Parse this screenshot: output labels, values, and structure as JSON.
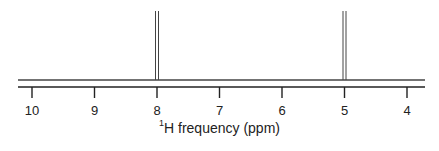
{
  "chart_data": {
    "type": "line",
    "title": "",
    "xlabel": "1H frequency (ppm)",
    "xlabel_parts": {
      "superscript": "1",
      "text": "H frequency (ppm)"
    },
    "ylabel": "",
    "xlim": [
      10.2,
      3.7
    ],
    "x_reversed": true,
    "grid": false,
    "legend": null,
    "x_ticks": [
      10,
      9,
      8,
      7,
      6,
      5,
      4
    ],
    "x_tick_labels": [
      "10",
      "9",
      "8",
      "7",
      "6",
      "5",
      "4"
    ],
    "peaks": [
      {
        "ppm": 8.0,
        "relative_height": 1.0,
        "shape": "doublet-line"
      },
      {
        "ppm": 5.0,
        "relative_height": 1.0,
        "shape": "doublet-line"
      }
    ],
    "series": [
      {
        "name": "1H NMR spectrum",
        "x": [
          10.2,
          8.0,
          8.0,
          8.0,
          5.0,
          5.0,
          5.0,
          3.7
        ],
        "y": [
          0,
          0,
          1,
          0,
          0,
          1,
          0,
          0
        ]
      }
    ]
  },
  "colors": {
    "line": "#444444",
    "axis": "#222222",
    "background": "#ffffff"
  }
}
